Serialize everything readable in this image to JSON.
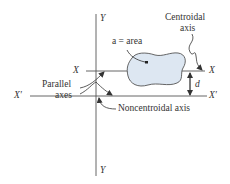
{
  "figure": {
    "axis_labels": {
      "y_top": "Y",
      "y_bottom": "Y",
      "x_left": "X",
      "x_right": "X",
      "xp_left": "X′",
      "xp_right": "X′"
    },
    "annotations": {
      "area": "a = area",
      "centroidal_line1": "Centroidal",
      "centroidal_line2": "axis",
      "parallel_line1": "Parallel",
      "parallel_line2": "axes",
      "noncentroidal": "Noncentroidal axis",
      "distance": "d"
    },
    "colors": {
      "line": "#555555",
      "shape_fill": "#dde7f2",
      "shape_stroke": "#555555",
      "text": "#333333"
    }
  }
}
